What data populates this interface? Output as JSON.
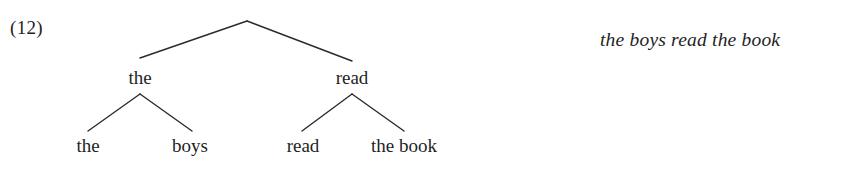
{
  "figure": {
    "example_number": "(12)",
    "gloss": "the boys read the book",
    "tree": {
      "root": {
        "label": "",
        "children": [
          {
            "label": "the",
            "children": [
              {
                "label": "the",
                "children": []
              },
              {
                "label": "boys",
                "children": []
              }
            ]
          },
          {
            "label": "read",
            "children": [
              {
                "label": "read",
                "children": []
              },
              {
                "label": "the book",
                "children": []
              }
            ]
          }
        ]
      },
      "nodes": {
        "root_apex": {
          "x": 247,
          "y": 21
        },
        "left_internal": {
          "label": "the",
          "x": 140,
          "y": 78
        },
        "right_internal": {
          "label": "read",
          "x": 352,
          "y": 78
        },
        "leaf_1": {
          "label": "the",
          "x": 88,
          "y": 146
        },
        "leaf_2": {
          "label": "boys",
          "x": 190,
          "y": 146
        },
        "leaf_3": {
          "label": "read",
          "x": 303,
          "y": 146
        },
        "leaf_4": {
          "label": "the book",
          "x": 402,
          "y": 146
        }
      }
    },
    "style": {
      "line_color": "#2b2b2b",
      "text_color": "#1f1f1f",
      "background": "#ffffff"
    }
  }
}
